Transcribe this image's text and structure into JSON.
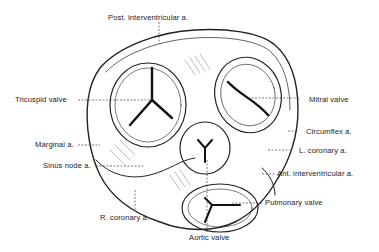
{
  "figure": {
    "labels": {
      "post_interventricular": "Post. interventricular a.",
      "tricuspid_valve": "Tricuspid valve",
      "mitral_valve": "Mitral valve",
      "circumflex": "Circumflex a.",
      "marginal": "Marginal a.",
      "l_coronary": "L. coronary a.",
      "sinus_node": "Sinus node a.",
      "ant_interventricular": "Ant. interventricular a.",
      "pulmonary_valve": "Pulmonary valve",
      "r_coronary": "R. coronary a.",
      "aortic_valve": "Aortic valve"
    },
    "colors": {
      "ink": "#1a1a1a",
      "background": "#ffffff"
    }
  }
}
